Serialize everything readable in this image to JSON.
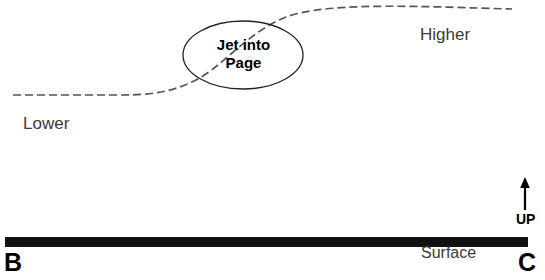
{
  "figure": {
    "type": "physics-schematic-diagram",
    "clipped_header_fragment": "",
    "labels": {
      "lower": "Lower",
      "higher": "Higher",
      "surface": "Surface",
      "up": "UP",
      "left_endpoint": "B",
      "right_endpoint": "C",
      "jet_line1": "Jet into",
      "jet_line2": "Page"
    },
    "colors": {
      "ink": "#1a1a1a",
      "dashed_curve": "#555555",
      "ellipse_stroke": "#222222",
      "surface_bar": "#111111",
      "arrow": "#000000",
      "background": "#ffffff"
    },
    "geometry": {
      "canvas_width": 545,
      "canvas_height": 280,
      "dashed_curve_start": [
        13,
        95
      ],
      "dashed_curve_end": [
        512,
        9
      ],
      "dash_pattern": "8 4",
      "ellipse_center": [
        243,
        55
      ],
      "ellipse_rx": 60,
      "ellipse_ry": 34,
      "surface_bar_x0": 5,
      "surface_bar_x1": 528,
      "surface_bar_y": 242,
      "surface_bar_thickness": 10,
      "up_arrow_x": 525,
      "up_arrow_y_tail": 210,
      "up_arrow_y_head": 179
    }
  }
}
